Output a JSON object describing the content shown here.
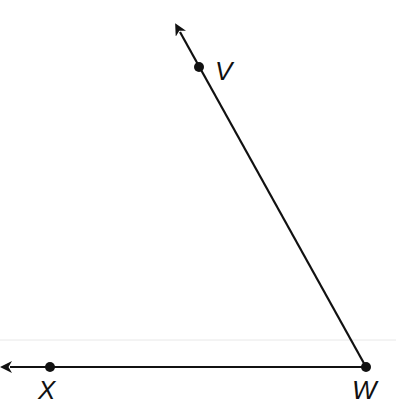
{
  "diagram": {
    "type": "angle",
    "vertex": {
      "label": "W",
      "x": 366,
      "y": 367
    },
    "rays": [
      {
        "name": "ray-WV",
        "through": {
          "label": "V",
          "x": 199,
          "y": 67
        },
        "arrow_tip": {
          "x": 176,
          "y": 25
        }
      },
      {
        "name": "ray-WX",
        "through": {
          "label": "X",
          "x": 50,
          "y": 367
        },
        "arrow_tip": {
          "x": 3,
          "y": 367
        }
      }
    ],
    "labels": {
      "v": "V",
      "w": "W",
      "x": "X"
    },
    "colors": {
      "stroke": "#111111",
      "background": "#ffffff",
      "faint_line": "#e6e6e6"
    }
  }
}
